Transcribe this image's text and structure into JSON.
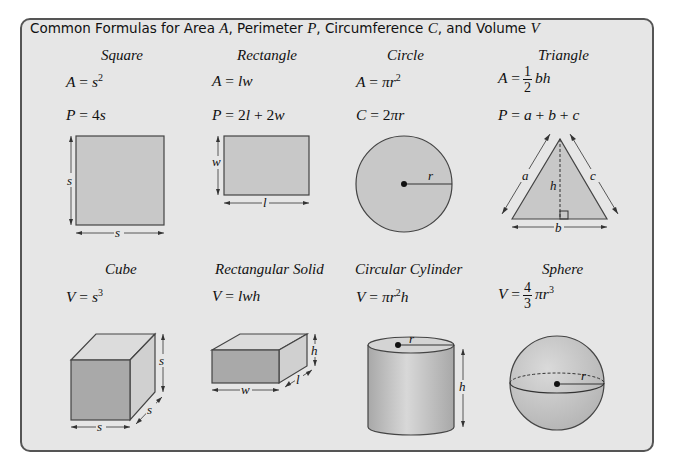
{
  "heading": {
    "prefix": "Common Formulas for Area ",
    "var_area": "A",
    "sep1": ", Perimeter ",
    "var_perimeter": "P",
    "sep2": ", Circumference ",
    "var_circumference": "C",
    "sep3": ", and Volume ",
    "var_volume": "V"
  },
  "shapes": {
    "square": {
      "title": "Square",
      "formula1": {
        "lhs": "A",
        "rhs": "s",
        "exp": "2"
      },
      "formula2": {
        "lhs": "P",
        "coef": "4",
        "var": "s"
      },
      "labels": {
        "side_left": "s",
        "side_bottom": "s"
      }
    },
    "rectangle": {
      "title": "Rectangle",
      "formula1": {
        "lhs": "A",
        "rhs": "lw"
      },
      "formula2": {
        "lhs": "P",
        "t1coef": "2",
        "t1var": "l",
        "op": "+",
        "t2coef": "2",
        "t2var": "w"
      },
      "labels": {
        "width": "w",
        "length": "l"
      }
    },
    "circle": {
      "title": "Circle",
      "formula1": {
        "lhs": "A",
        "rhs": "πr",
        "exp": "2"
      },
      "formula2": {
        "lhs": "C",
        "coef": "2",
        "rhs": "πr"
      },
      "labels": {
        "radius": "r"
      }
    },
    "triangle": {
      "title": "Triangle",
      "formula1": {
        "lhs": "A",
        "num": "1",
        "den": "2",
        "rhs": "bh"
      },
      "formula2": {
        "lhs": "P",
        "rhs_a": "a",
        "op1": "+",
        "rhs_b": "b",
        "op2": "+",
        "rhs_c": "c"
      },
      "labels": {
        "a": "a",
        "b": "b",
        "c": "c",
        "h": "h"
      }
    },
    "cube": {
      "title": "Cube",
      "formula1": {
        "lhs": "V",
        "rhs": "s",
        "exp": "3"
      },
      "labels": {
        "height": "s",
        "depth": "s",
        "width": "s"
      }
    },
    "rectangular_solid": {
      "title": "Rectangular Solid",
      "formula1": {
        "lhs": "V",
        "rhs": "lwh"
      },
      "labels": {
        "height": "h",
        "length": "l",
        "width": "w"
      }
    },
    "cylinder": {
      "title": "Circular Cylinder",
      "formula1": {
        "lhs": "V",
        "rhs": "πr",
        "exp": "2",
        "tail": "h"
      },
      "labels": {
        "radius": "r",
        "height": "h"
      }
    },
    "sphere": {
      "title": "Sphere",
      "formula1": {
        "lhs": "V",
        "num": "4",
        "den": "3",
        "rhs": "πr",
        "exp": "3"
      },
      "labels": {
        "radius": "r"
      }
    }
  },
  "colors": {
    "panel_bg": "#e6e6e6",
    "shape_fill": "#c8c8c8",
    "dark_face": "#a9a9a9",
    "border": "#555555"
  }
}
